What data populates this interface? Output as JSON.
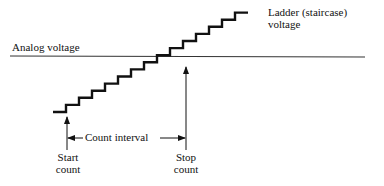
{
  "diagram": {
    "type": "staircase-ramp ADC timing",
    "labels": {
      "analog_voltage": "Analog voltage",
      "ladder_line1": "Ladder (staircase)",
      "ladder_line2": "voltage",
      "count_interval": "Count interval",
      "start_line1": "Start",
      "start_line2": "count",
      "stop_line1": "Stop",
      "stop_line2": "count"
    },
    "staircase": {
      "steps": 15,
      "stop_step_index": 10
    },
    "colors": {
      "line": "#111111",
      "reference": "#333333"
    }
  }
}
